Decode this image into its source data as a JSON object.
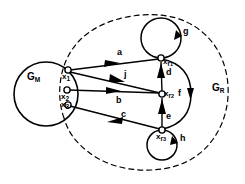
{
  "figure": {
    "regions": [
      {
        "id": "gm",
        "label": "G",
        "sub": "M",
        "x": 27,
        "y": 72,
        "shape": "solid-circle"
      },
      {
        "id": "gr",
        "label": "G",
        "sub": "R",
        "x": 212,
        "y": 83,
        "shape": "dashed-ellipse"
      }
    ],
    "nodes": [
      {
        "id": "x1",
        "label": "x",
        "sub": "1",
        "cx": 68,
        "cy": 70,
        "lx": 62,
        "ly": 73
      },
      {
        "id": "x2",
        "label": "x",
        "sub": "2",
        "cx": 67,
        "cy": 90,
        "lx": 61,
        "ly": 93
      },
      {
        "id": "x3",
        "label": "x",
        "sub": "3",
        "cx": 68,
        "cy": 105,
        "lx": 61,
        "ly": 101
      },
      {
        "id": "xr1",
        "label": "x",
        "sub": "r",
        "sub2": "1",
        "cx": 161,
        "cy": 58,
        "lx": 163,
        "ly": 59
      },
      {
        "id": "xr2",
        "label": "x",
        "sub": "r",
        "sub2": "2",
        "cx": 162,
        "cy": 94,
        "lx": 164,
        "ly": 95
      },
      {
        "id": "xr3",
        "label": "x",
        "sub": "r",
        "sub2": "3",
        "cx": 162,
        "cy": 130,
        "lx": 157,
        "ly": 133
      }
    ],
    "edges": [
      {
        "id": "a",
        "label": "a",
        "from": "x1",
        "to": "xr1",
        "lx": 117,
        "ly": 50
      },
      {
        "id": "j",
        "label": "j",
        "from": "x1",
        "to": "xr2",
        "lx": 124,
        "ly": 72
      },
      {
        "id": "b",
        "label": "b",
        "from": "x2",
        "to": "xr2",
        "lx": 117,
        "ly": 95
      },
      {
        "id": "c",
        "label": "c",
        "from": "x3",
        "to": "xr3",
        "lx": 120,
        "ly": 113
      },
      {
        "id": "d",
        "label": "d",
        "from": "xr2",
        "to": "xr1",
        "lx": 166,
        "ly": 71
      },
      {
        "id": "e",
        "label": "e",
        "from": "xr3",
        "to": "xr2",
        "lx": 166,
        "ly": 115
      },
      {
        "id": "f",
        "label": "f",
        "from": "xr1",
        "to": "xr3",
        "lx": 179,
        "ly": 89
      },
      {
        "id": "g",
        "label": "g",
        "from": "xr1",
        "to": "xr1",
        "lx": 183,
        "ly": 28
      },
      {
        "id": "h",
        "label": "h",
        "from": "xr3",
        "to": "xr3",
        "lx": 180,
        "ly": 136
      }
    ],
    "colors": {
      "stroke": "#000000",
      "background": "#ffffff",
      "node_fill": "#ffffff"
    }
  }
}
